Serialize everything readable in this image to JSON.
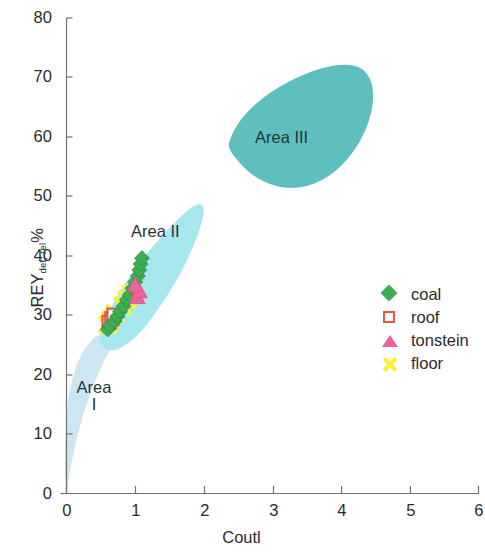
{
  "chart_data": {
    "type": "scatter",
    "title": "",
    "xlabel": "Coutl",
    "ylabel": "REY",
    "ylabel_sub": "def, rel",
    "ylabel_unit": "%",
    "xlim": [
      0,
      6
    ],
    "ylim": [
      0,
      80
    ],
    "xticks": [
      "0",
      "1",
      "2",
      "3",
      "4",
      "5",
      "6"
    ],
    "yticks": [
      "0",
      "10",
      "20",
      "30",
      "40",
      "50",
      "60",
      "70",
      "80"
    ],
    "grid": false,
    "legend_position": "right-middle",
    "series": [
      {
        "name": "coal",
        "marker": "diamond",
        "color": "#3dad52",
        "points": [
          [
            0.6,
            27.6
          ],
          [
            0.64,
            28.3
          ],
          [
            0.7,
            29.0
          ],
          [
            0.74,
            29.8
          ],
          [
            0.78,
            30.6
          ],
          [
            0.83,
            31.5
          ],
          [
            0.88,
            32.6
          ],
          [
            0.92,
            33.4
          ],
          [
            0.96,
            34.5
          ],
          [
            1.0,
            35.6
          ],
          [
            1.04,
            36.6
          ],
          [
            1.06,
            37.6
          ],
          [
            1.08,
            38.6
          ],
          [
            1.1,
            39.6
          ]
        ]
      },
      {
        "name": "roof",
        "marker": "open-square",
        "color": "#e0593f",
        "points": [
          [
            0.62,
            28.8
          ],
          [
            0.66,
            29.4
          ],
          [
            0.69,
            30.0
          ]
        ]
      },
      {
        "name": "tonstein",
        "marker": "triangle",
        "color": "#ef6296",
        "points": [
          [
            1.03,
            33.0
          ],
          [
            1.06,
            34.0
          ],
          [
            1.0,
            35.0
          ]
        ]
      },
      {
        "name": "floor",
        "marker": "x",
        "color": "#f7f233",
        "points": [
          [
            0.6,
            28.4
          ],
          [
            0.64,
            29.2
          ],
          [
            0.7,
            30.2
          ],
          [
            0.82,
            31.6
          ],
          [
            0.88,
            32.6
          ],
          [
            0.94,
            33.6
          ]
        ]
      }
    ],
    "regions": [
      {
        "label": "Area",
        "label2": "I",
        "name": "Area I",
        "color": "#cde6f2"
      },
      {
        "label": "Area II",
        "name": "Area II",
        "color": "#a7e8ee"
      },
      {
        "label": "Area III",
        "name": "Area III",
        "color": "#5fbfbf"
      }
    ]
  },
  "legend": {
    "items": [
      {
        "label": "coal",
        "marker": "diamond",
        "color": "#3dad52"
      },
      {
        "label": "roof",
        "marker": "open-square",
        "color": "#e0593f"
      },
      {
        "label": "tonstein",
        "marker": "triangle",
        "color": "#ef6296"
      },
      {
        "label": "floor",
        "marker": "x",
        "color": "#f7f233"
      }
    ]
  }
}
